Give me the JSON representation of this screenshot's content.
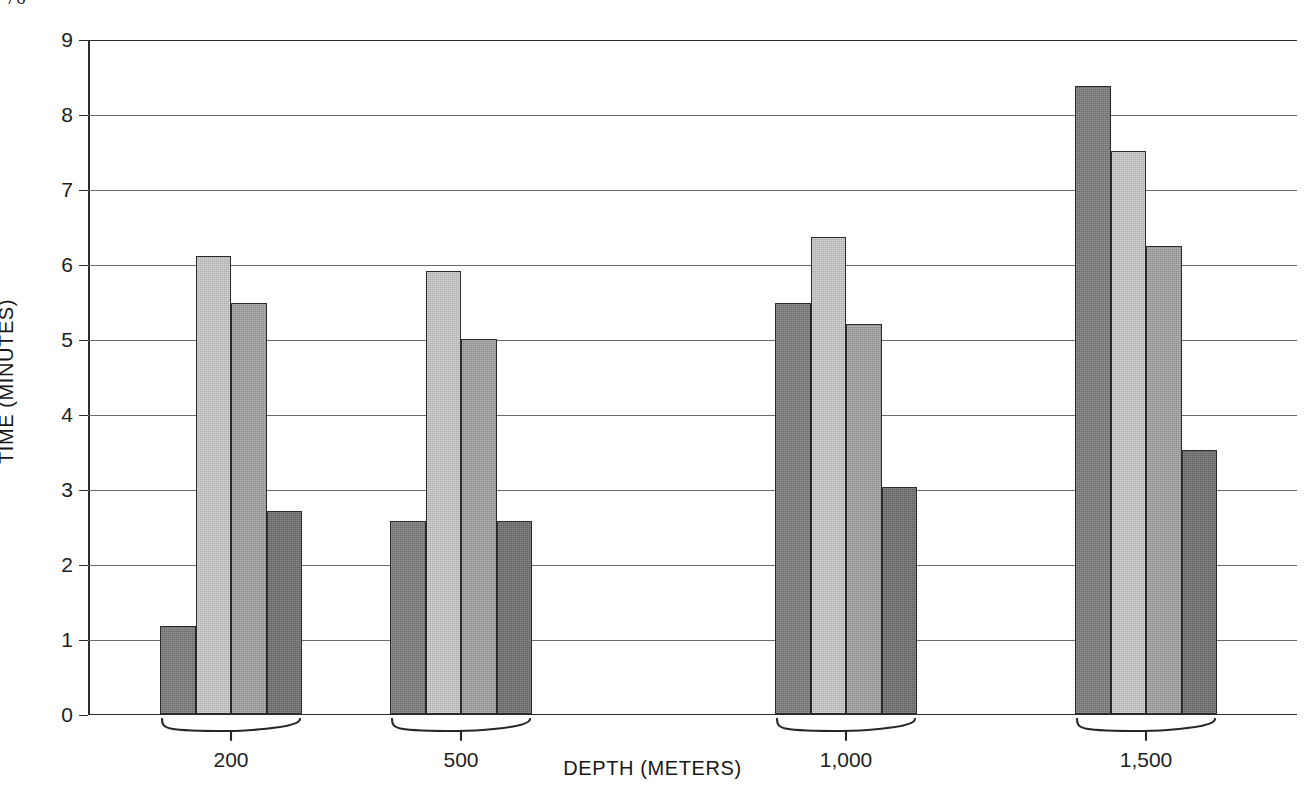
{
  "folio": "76",
  "chart_data": {
    "type": "bar",
    "title": "",
    "xlabel": "DEPTH (METERS)",
    "ylabel": "TIME (MINUTES)",
    "categories": [
      "200",
      "500",
      "1,000",
      "1,500"
    ],
    "series": [
      {
        "name": "series-1",
        "color": "#7b7b7b",
        "values": [
          1.17,
          2.57,
          5.47,
          8.37
        ]
      },
      {
        "name": "series-2",
        "color": "#c9c9c9",
        "values": [
          6.1,
          5.9,
          6.35,
          7.5
        ]
      },
      {
        "name": "series-3",
        "color": "#a2a2a2",
        "values": [
          5.47,
          5.0,
          5.2,
          6.23
        ]
      },
      {
        "name": "series-4",
        "color": "#6d6d6d",
        "values": [
          2.7,
          2.57,
          3.02,
          3.51
        ]
      }
    ],
    "ylim": [
      0,
      9
    ],
    "yticks": [
      "0",
      "1",
      "2",
      "3",
      "4",
      "5",
      "6",
      "7",
      "8",
      "9"
    ],
    "grid": true,
    "legend": "none"
  }
}
